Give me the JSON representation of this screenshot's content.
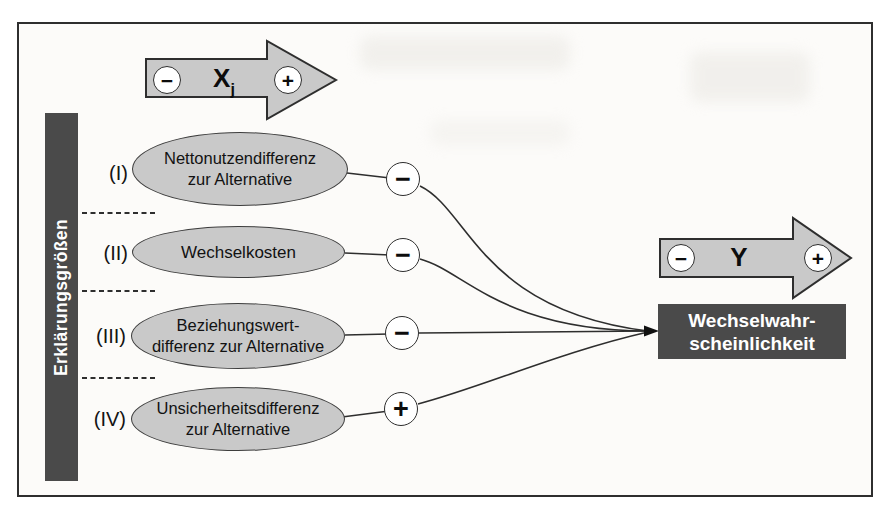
{
  "diagram": {
    "left_bar": {
      "label": "Erklärungsgrößen"
    },
    "x_axis_arrow": {
      "label_main": "X",
      "label_sub": "j",
      "minus": "−",
      "plus": "+"
    },
    "y_axis_arrow": {
      "label": "Y",
      "minus": "−",
      "plus": "+"
    },
    "rows": [
      {
        "index": "(I)",
        "label": "Nettonutzendifferenz\nzur Alternative",
        "sign": "−"
      },
      {
        "index": "(II)",
        "label": "Wechselkosten",
        "sign": "−"
      },
      {
        "index": "(III)",
        "label": "Beziehungswert-\ndifferenz zur Alternative",
        "sign": "−"
      },
      {
        "index": "(IV)",
        "label": "Unsicherheitsdifferenz\nzur Alternative",
        "sign": "+"
      }
    ],
    "outcome_box": {
      "label": "Wechselwahr-\nscheinlichkeit"
    },
    "colors": {
      "shape_fill": "#c9c9c9",
      "shape_border": "#2e2e2e",
      "dark_fill": "#4a4a4a",
      "dark_text": "#ffffff",
      "frame_background": "#fcfbf9"
    }
  }
}
